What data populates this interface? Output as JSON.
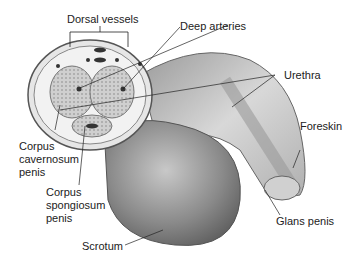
{
  "diagram": {
    "labels": {
      "dorsal_vessels": "Dorsal vessels",
      "deep_arteries": "Deep arteries",
      "urethra": "Urethra",
      "foreskin": "Foreskin",
      "corpus_cavernosum_1": "Corpus",
      "corpus_cavernosum_2": "cavernosum",
      "corpus_cavernosum_3": "penis",
      "corpus_spongiosum_1": "Corpus",
      "corpus_spongiosum_2": "spongiosum",
      "corpus_spongiosum_3": "penis",
      "glans_penis": "Glans penis",
      "scrotum": "Scrotum"
    }
  }
}
